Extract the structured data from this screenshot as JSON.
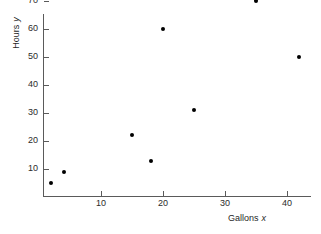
{
  "chart_data": {
    "type": "scatter",
    "title": "",
    "xlabel": "Gallons",
    "xlabel_variable": "x",
    "ylabel": "Hours",
    "ylabel_variable": "y",
    "xlim": [
      0,
      44
    ],
    "ylim": [
      0,
      73
    ],
    "grid": false,
    "legend": null,
    "x_ticks": [
      10,
      20,
      30,
      40
    ],
    "y_ticks": [
      10,
      20,
      30,
      40,
      50,
      60,
      70
    ],
    "x_tick_labels": [
      "10",
      "20",
      "30",
      "40"
    ],
    "y_tick_labels": [
      "10",
      "20",
      "30",
      "40",
      "50",
      "60",
      "70"
    ],
    "points": [
      {
        "x": 2,
        "y": 5
      },
      {
        "x": 4,
        "y": 9
      },
      {
        "x": 15,
        "y": 22
      },
      {
        "x": 18,
        "y": 13
      },
      {
        "x": 20,
        "y": 60
      },
      {
        "x": 25,
        "y": 31
      },
      {
        "x": 35,
        "y": 70
      },
      {
        "x": 42,
        "y": 50
      }
    ],
    "marker": "filled-circle",
    "marker_color": "#000000",
    "axis_color": "#5a5a5a",
    "background_color": "#ffffff"
  }
}
